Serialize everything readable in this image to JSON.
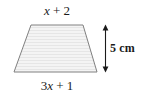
{
  "figure": {
    "type": "trapezoid-diagram",
    "background_color": "#ffffff",
    "shape": {
      "name": "trapezoid",
      "fill_color": "#f2f2f2",
      "stroke_color": "#808080",
      "stroke_width": 1,
      "hatch_color": "#e4e4e4",
      "points": "31,25 83,25 97,72 14,72",
      "vertices": [
        {
          "label": "top-left",
          "x": 31,
          "y": 25
        },
        {
          "label": "top-right",
          "x": 83,
          "y": 25
        },
        {
          "label": "bottom-right",
          "x": 97,
          "y": 72
        },
        {
          "label": "bottom-left",
          "x": 14,
          "y": 72
        }
      ]
    },
    "labels": {
      "top": {
        "name": "top-side-length",
        "coefficient": "",
        "variable": "x",
        "operator": " + ",
        "constant": "2",
        "full_text": "x + 2"
      },
      "bottom": {
        "name": "bottom-side-length",
        "coefficient": "3",
        "variable": "x",
        "operator": " + ",
        "constant": "1",
        "full_text": "3x + 1"
      },
      "height": {
        "name": "height-measure",
        "value": "5",
        "unit": "cm",
        "full_text": "5 cm"
      }
    },
    "dimension_arrow": {
      "name": "height-arrow",
      "orientation": "vertical",
      "double_headed": true,
      "color": "#1a1a1a",
      "x": 105.5,
      "y_top": 25,
      "y_bottom": 72,
      "head_half_width": 3,
      "head_length": 5.5
    }
  }
}
